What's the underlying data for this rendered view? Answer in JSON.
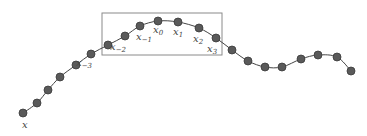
{
  "diagram": {
    "colors": {
      "curve": "#444444",
      "point_fill": "#5a5a5a",
      "point_stroke": "#3a3a3a",
      "window_stroke": "#8a8a8a",
      "label": "#444444"
    },
    "points": [
      [
        23,
        113
      ],
      [
        37,
        103
      ],
      [
        48,
        90
      ],
      [
        60,
        77
      ],
      [
        76,
        65
      ],
      [
        91,
        54
      ],
      [
        108,
        45
      ],
      [
        125,
        36
      ],
      [
        140,
        26
      ],
      [
        158,
        21
      ],
      [
        178,
        22
      ],
      [
        199,
        28
      ],
      [
        216,
        38
      ],
      [
        232,
        50
      ],
      [
        248,
        61
      ],
      [
        265,
        67
      ],
      [
        282,
        67
      ],
      [
        301,
        59
      ],
      [
        318,
        55
      ],
      [
        337,
        57
      ],
      [
        351,
        71
      ]
    ],
    "window": {
      "x": 102,
      "y": 13,
      "width": 120,
      "height": 42
    },
    "labels": [
      {
        "id": "x",
        "base": "x",
        "sub": "",
        "x": 22,
        "y": 128
      },
      {
        "id": "x-3",
        "base": "x",
        "sub": "−3",
        "x": 76,
        "y": 66
      },
      {
        "id": "x-2",
        "base": "x",
        "sub": "−2",
        "x": 110,
        "y": 50
      },
      {
        "id": "x-1",
        "base": "x",
        "sub": "−1",
        "x": 136,
        "y": 40
      },
      {
        "id": "x0",
        "base": "x",
        "sub": "0",
        "x": 153,
        "y": 33
      },
      {
        "id": "x1",
        "base": "x",
        "sub": "1",
        "x": 173,
        "y": 35
      },
      {
        "id": "x2",
        "base": "x",
        "sub": "2",
        "x": 193,
        "y": 42
      },
      {
        "id": "x3",
        "base": "x",
        "sub": "3",
        "x": 207,
        "y": 52
      }
    ]
  }
}
